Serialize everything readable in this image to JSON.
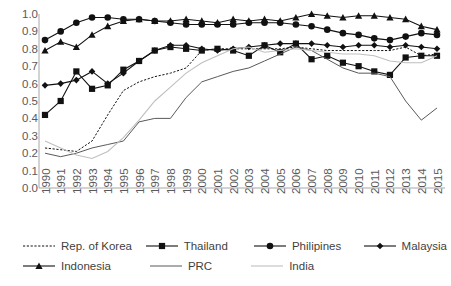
{
  "chart_data": {
    "type": "line",
    "title": "",
    "xlabel": "",
    "ylabel": "",
    "ylim": [
      0.0,
      1.0
    ],
    "ytick_step": 0.1,
    "grid": false,
    "legend_position": "bottom",
    "yticks": [
      "1.0",
      "0.9",
      "0.8",
      "0.7",
      "0.6",
      "0.5",
      "0.4",
      "0.3",
      "0.2",
      "0.1",
      "0.0"
    ],
    "categories": [
      "1990",
      "1991",
      "1992",
      "1993",
      "1994",
      "1995",
      "1996",
      "1997",
      "1998",
      "1999",
      "2000",
      "2001",
      "2002",
      "2003",
      "2004",
      "2005",
      "2006",
      "2007",
      "2008",
      "2009",
      "2010",
      "2011",
      "2012",
      "2013",
      "2014",
      "2015"
    ],
    "series": [
      {
        "name": "Rep. of Korea",
        "marker": "none",
        "line_style": "dotted",
        "color": "#111111",
        "values": [
          0.23,
          0.22,
          0.21,
          0.27,
          0.42,
          0.56,
          0.61,
          0.64,
          0.66,
          0.69,
          0.79,
          0.8,
          0.8,
          0.8,
          0.8,
          0.8,
          0.81,
          0.8,
          0.79,
          0.79,
          0.79,
          0.79,
          0.79,
          0.81,
          0.76,
          0.77
        ]
      },
      {
        "name": "Thailand",
        "marker": "square",
        "line_style": "solid",
        "color": "#111111",
        "values": [
          0.42,
          0.5,
          0.67,
          0.57,
          0.59,
          0.68,
          0.73,
          0.79,
          0.81,
          0.8,
          0.79,
          0.8,
          0.79,
          0.76,
          0.82,
          0.78,
          0.83,
          0.74,
          0.76,
          0.72,
          0.7,
          0.67,
          0.65,
          0.75,
          0.76,
          0.76
        ]
      },
      {
        "name": "Philipines",
        "marker": "circle",
        "line_style": "solid",
        "color": "#111111",
        "values": [
          0.85,
          0.9,
          0.95,
          0.98,
          0.98,
          0.97,
          0.97,
          0.96,
          0.95,
          0.94,
          0.94,
          0.94,
          0.94,
          0.95,
          0.95,
          0.95,
          0.94,
          0.93,
          0.91,
          0.89,
          0.88,
          0.86,
          0.85,
          0.87,
          0.89,
          0.88
        ]
      },
      {
        "name": "Malaysia",
        "marker": "diamond",
        "line_style": "solid",
        "color": "#111111",
        "values": [
          0.59,
          0.6,
          0.62,
          0.67,
          0.6,
          0.66,
          0.73,
          0.79,
          0.82,
          0.82,
          0.8,
          0.79,
          0.8,
          0.81,
          0.82,
          0.83,
          0.83,
          0.83,
          0.82,
          0.81,
          0.82,
          0.82,
          0.81,
          0.82,
          0.81,
          0.8
        ]
      },
      {
        "name": "Indonesia",
        "marker": "triangle",
        "line_style": "solid",
        "color": "#111111",
        "values": [
          0.79,
          0.84,
          0.81,
          0.88,
          0.93,
          0.96,
          0.97,
          0.96,
          0.96,
          0.97,
          0.96,
          0.95,
          0.97,
          0.96,
          0.97,
          0.96,
          0.98,
          1.0,
          0.99,
          0.98,
          0.99,
          0.99,
          0.98,
          0.97,
          0.93,
          0.91
        ]
      },
      {
        "name": "PRC",
        "marker": "none",
        "line_style": "solid",
        "color": "#595959",
        "values": [
          0.2,
          0.18,
          0.2,
          0.23,
          0.25,
          0.27,
          0.38,
          0.4,
          0.4,
          0.52,
          0.61,
          0.64,
          0.67,
          0.69,
          0.73,
          0.77,
          0.81,
          0.79,
          0.74,
          0.69,
          0.66,
          0.66,
          0.64,
          0.5,
          0.39,
          0.46
        ]
      },
      {
        "name": "India",
        "marker": "none",
        "line_style": "solid-light",
        "color": "#bfbfbf",
        "values": [
          0.27,
          0.23,
          0.19,
          0.17,
          0.21,
          0.29,
          0.39,
          0.5,
          0.58,
          0.66,
          0.72,
          0.76,
          0.8,
          0.81,
          0.78,
          0.79,
          0.8,
          0.79,
          0.78,
          0.77,
          0.77,
          0.76,
          0.73,
          0.72,
          0.72,
          0.76
        ]
      }
    ]
  },
  "legend": {
    "rows": [
      [
        {
          "label": "Rep. of Korea",
          "marker": "none",
          "style": "dotted"
        },
        {
          "label": "Thailand",
          "marker": "square",
          "style": "solid"
        },
        {
          "label": "Philipines",
          "marker": "circle",
          "style": "solid"
        },
        {
          "label": "Malaysia",
          "marker": "diamond",
          "style": "solid"
        }
      ],
      [
        {
          "label": "Indonesia",
          "marker": "triangle",
          "style": "solid"
        },
        {
          "label": "PRC",
          "marker": "none",
          "style": "solid"
        },
        {
          "label": "India",
          "marker": "none",
          "style": "solid-light"
        }
      ]
    ]
  }
}
